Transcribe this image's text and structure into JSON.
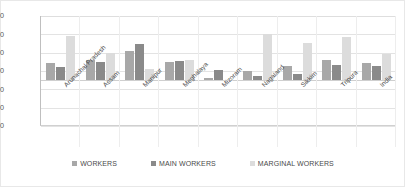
{
  "chart_data": {
    "type": "bar",
    "title": "",
    "subtitle": "",
    "xlabel": "",
    "ylabel": "",
    "ylim": [
      -5.0,
      7.0
    ],
    "ytick_labels": [
      "7.00",
      "5.00",
      "3.00",
      "1.00",
      "-1.00",
      "-3.00",
      "-5.00"
    ],
    "ytick_values": [
      7.0,
      5.0,
      3.0,
      1.0,
      -1.0,
      -3.0,
      -5.0
    ],
    "grid": true,
    "legend_position": "bottom",
    "categories": [
      "Arunachal Pradesh",
      "Assam",
      "Manipur",
      "Meghalaya",
      "Mizoram",
      "Nagaland",
      "Sikkim",
      "Tripura",
      "India"
    ],
    "series": [
      {
        "name": "WORKERS",
        "color": "#a8a8a8",
        "values": [
          1.9,
          2.2,
          3.2,
          2.0,
          0.25,
          1.0,
          1.5,
          2.2,
          1.9
        ]
      },
      {
        "name": "MAIN WORKERS",
        "color": "#8a8a8a",
        "values": [
          1.4,
          2.0,
          4.0,
          2.1,
          1.1,
          0.5,
          0.7,
          1.7,
          1.5
        ]
      },
      {
        "name": "MARGINAL WORKERS",
        "color": "#dcdcdc",
        "values": [
          4.8,
          3.0,
          1.2,
          2.2,
          -0.1,
          5.0,
          4.1,
          4.7,
          2.9
        ]
      }
    ]
  },
  "legend": {
    "items": [
      {
        "label": "WORKERS"
      },
      {
        "label": "MAIN WORKERS"
      },
      {
        "label": "MARGINAL WORKERS"
      }
    ]
  }
}
